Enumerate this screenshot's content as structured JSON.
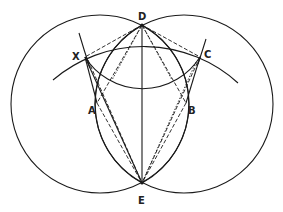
{
  "diagram": {
    "points": {
      "D": {
        "label": "D",
        "x": 142,
        "y": 25
      },
      "E": {
        "label": "E",
        "x": 142,
        "y": 183
      },
      "X": {
        "label": "X",
        "x": 85,
        "y": 57
      },
      "C": {
        "label": "C",
        "x": 200,
        "y": 57
      },
      "A": {
        "label": "A",
        "x": 97,
        "y": 103
      },
      "B": {
        "label": "B",
        "x": 186,
        "y": 103
      }
    },
    "circles": [
      {
        "name": "left-circle",
        "cx": 100,
        "cy": 104,
        "r": 89
      },
      {
        "name": "right-circle",
        "cx": 184,
        "cy": 104,
        "r": 89
      }
    ],
    "arcs": [
      {
        "name": "upper-arc-centered-E",
        "cx": 142,
        "cy": 183,
        "r": 140
      },
      {
        "name": "lower-arc-centered-D",
        "cx": 142,
        "cy": 25,
        "r": 68
      },
      {
        "name": "lens-left-arc"
      },
      {
        "name": "lens-right-arc"
      },
      {
        "name": "arc-through-X"
      },
      {
        "name": "arc-through-C"
      }
    ],
    "line_color": "#1a1a1a",
    "background": "#ffffff"
  }
}
